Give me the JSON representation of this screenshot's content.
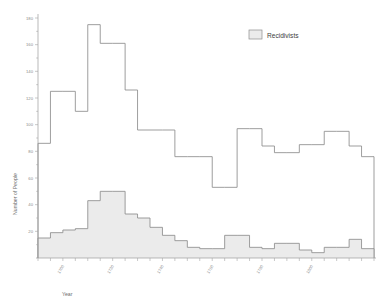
{
  "chart_data": {
    "type": "area",
    "title": "",
    "xlabel": "Year",
    "ylabel": "Number of People",
    "xlim": [
      1690,
      1825
    ],
    "ylim": [
      0,
      180
    ],
    "grid": false,
    "legend_position": "top-right",
    "bin_width": 5,
    "x": [
      1690,
      1695,
      1700,
      1705,
      1710,
      1715,
      1720,
      1725,
      1730,
      1735,
      1740,
      1745,
      1750,
      1755,
      1760,
      1765,
      1770,
      1775,
      1780,
      1785,
      1790,
      1795,
      1800,
      1805,
      1810,
      1815,
      1820
    ],
    "xtick_labels": [
      "1700",
      "1720",
      "1740",
      "1760",
      "1780",
      "1800"
    ],
    "xtick_values": [
      1700,
      1720,
      1740,
      1760,
      1780,
      1800
    ],
    "ytick_labels": [
      "20",
      "40",
      "60",
      "80",
      "100",
      "120",
      "140",
      "160",
      "180"
    ],
    "ytick_values": [
      20,
      40,
      60,
      80,
      100,
      120,
      140,
      160,
      180
    ],
    "series": [
      {
        "name": "Total",
        "filled": false,
        "values": [
          86,
          125,
          125,
          110,
          175,
          161,
          161,
          126,
          96,
          96,
          96,
          76,
          76,
          76,
          53,
          53,
          97,
          97,
          84,
          79,
          79,
          85,
          85,
          95,
          95,
          84,
          76
        ]
      },
      {
        "name": "Recidivists",
        "filled": true,
        "values": [
          15,
          19,
          21,
          22,
          43,
          50,
          50,
          33,
          30,
          23,
          17,
          13,
          8,
          7,
          7,
          17,
          17,
          8,
          7,
          11,
          11,
          6,
          4,
          8,
          8,
          14,
          7
        ]
      }
    ],
    "legend": [
      {
        "label": "Recidivists",
        "color": "#ebebeb"
      }
    ]
  },
  "colors": {
    "series_line": "#8d8d8d",
    "fill": "#ebebeb",
    "axis": "#9b9b9b",
    "text": "#6e6e6e",
    "background": "#ffffff"
  }
}
